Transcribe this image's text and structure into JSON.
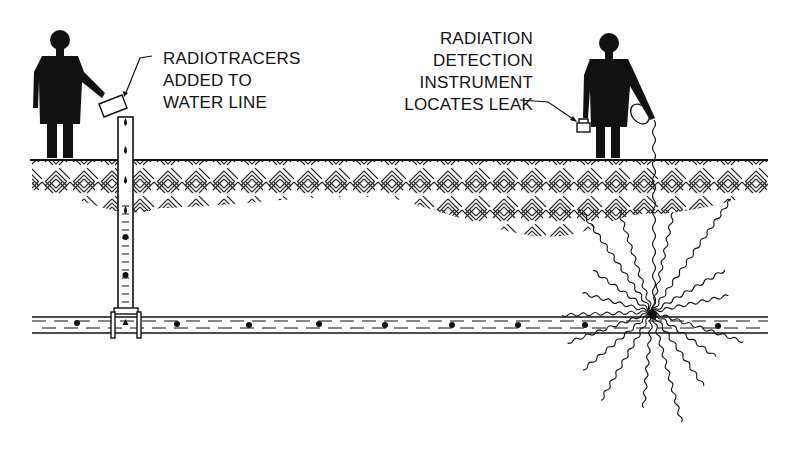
{
  "diagram": {
    "labels": {
      "tracer_input": [
        "RADIOTRACERS",
        "ADDED TO",
        "WATER LINE"
      ],
      "detector": [
        "RADIATION",
        "DETECTION",
        "INSTRUMENT",
        "LOCATES LEAK"
      ]
    },
    "components": [
      {
        "id": "worker-left",
        "description": "person pouring radiotracer"
      },
      {
        "id": "riser-pipe",
        "description": "vertical injection pipe with tracer droplets"
      },
      {
        "id": "soil-layer",
        "description": "cross-hatched ground layer"
      },
      {
        "id": "water-line",
        "description": "horizontal buried water pipe with tracer particles"
      },
      {
        "id": "worker-right",
        "description": "person holding radiation detector with probe cable"
      },
      {
        "id": "leak-point",
        "description": "leak with radiation emission (wavy lines)"
      }
    ],
    "colors": {
      "ink": "#111111",
      "background": "#ffffff"
    }
  }
}
